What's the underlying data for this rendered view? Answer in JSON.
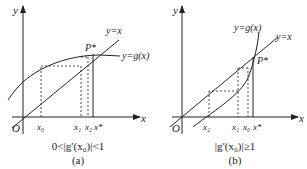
{
  "panels": [
    {
      "id": "a",
      "caption_condition": "0<|g′(x₀)|<1",
      "caption_label": "(a)",
      "axis_x": "x",
      "axis_y": "y",
      "origin": "O",
      "line_label": "y=x",
      "curve_label": "y=g(x)",
      "point_label": "P*",
      "ticks": [
        "x₀",
        "x₁",
        "x₂",
        "x*"
      ]
    },
    {
      "id": "b",
      "caption_condition": "|g′(x₀)|≥1",
      "caption_label": "(b)",
      "axis_x": "x",
      "axis_y": "y",
      "origin": "O",
      "line_label": "y=x",
      "curve_label": "y=g(x)",
      "point_label": "P*",
      "ticks": [
        "x₂",
        "x₁",
        "x₀",
        "x*"
      ]
    }
  ],
  "colors": {
    "ink": "#222222",
    "background": "#ffffff"
  }
}
